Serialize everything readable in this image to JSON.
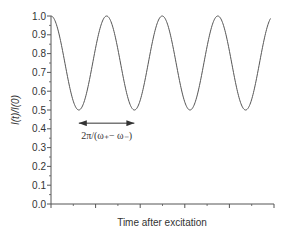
{
  "chart_data": {
    "type": "line",
    "title": "",
    "xlabel": "Time after excitation",
    "ylabel": "I(t)/I(0)",
    "ylim": [
      0.0,
      1.0
    ],
    "yticks": [
      "0.0",
      "0.1",
      "0.2",
      "0.3",
      "0.4",
      "0.5",
      "0.6",
      "0.7",
      "0.8",
      "0.9",
      "1.0"
    ],
    "xticks_major_count": 6,
    "xtick_labels": [],
    "grid": false,
    "legend": null,
    "series": [
      {
        "name": "I(t)/I(0)",
        "description": "cosine oscillation between 0.5 and 1.0, ~4 periods, starting at peak 1.0",
        "max": 1.0,
        "min": 0.5,
        "periods": 3.95,
        "x": [
          0,
          0.5,
          1,
          1.5,
          2,
          2.5,
          3,
          3.5,
          3.95
        ],
        "values": [
          1.0,
          0.5,
          1.0,
          0.5,
          1.0,
          0.5,
          1.0,
          0.5,
          0.98
        ]
      }
    ],
    "annotations": [
      {
        "type": "double-arrow",
        "text": "2π/(ω₊− ω₋)",
        "from_period": 0.5,
        "to_period": 1.5,
        "y": 0.43
      }
    ]
  }
}
